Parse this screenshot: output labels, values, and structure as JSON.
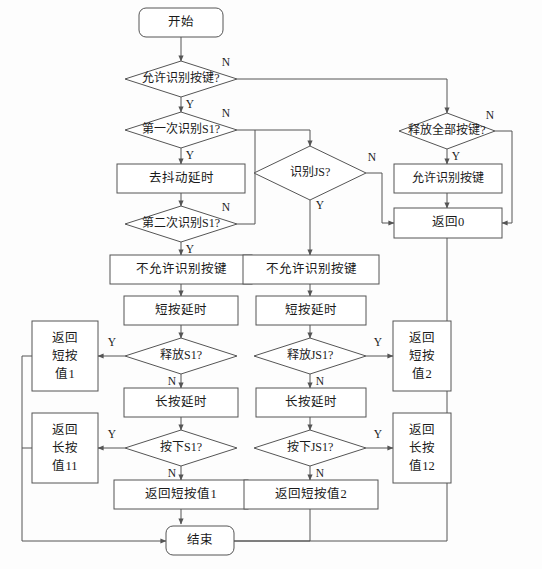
{
  "diagram": {
    "type": "flowchart",
    "colors": {
      "background": "#fdfdfd",
      "shape_fill": "#ffffff",
      "shape_stroke": "#555555",
      "text": "#1a1a1a"
    },
    "edge_labels": {
      "yes": "Y",
      "no": "N"
    },
    "nodes": {
      "start": {
        "text": "开始",
        "shape": "terminator"
      },
      "d_allow_detect": {
        "text": "允许识别按键?",
        "shape": "decision"
      },
      "d_first_s1": {
        "text": "第一次识别S1?",
        "shape": "decision"
      },
      "p_debounce": {
        "text": "去抖动延时",
        "shape": "process"
      },
      "d_second_s1": {
        "text": "第二次识别S1?",
        "shape": "decision"
      },
      "p_disallow_1": {
        "text": "不允许识别按键",
        "shape": "process"
      },
      "p_short_delay_1": {
        "text": "短按延时",
        "shape": "process"
      },
      "d_release_s1": {
        "text": "释放S1?",
        "shape": "decision"
      },
      "p_long_delay_1": {
        "text": "长按延时",
        "shape": "process"
      },
      "d_press_s1": {
        "text": "按下S1?",
        "shape": "decision"
      },
      "p_ret_short_1_inline": {
        "text": "返回短按值1",
        "shape": "process"
      },
      "d_detect_js": {
        "text": "识别JS?",
        "shape": "decision"
      },
      "p_disallow_2": {
        "text": "不允许识别按键",
        "shape": "process"
      },
      "p_short_delay_2": {
        "text": "短按延时",
        "shape": "process"
      },
      "d_release_js1": {
        "text": "释放JS1?",
        "shape": "decision"
      },
      "p_long_delay_2": {
        "text": "长按延时",
        "shape": "process"
      },
      "d_press_js1": {
        "text": "按下JS1?",
        "shape": "decision"
      },
      "p_ret_short_2_inline": {
        "text": "返回短按值2",
        "shape": "process"
      },
      "d_release_all": {
        "text": "释放全部按键?",
        "shape": "decision"
      },
      "p_allow_detect": {
        "text": "允许识别按键",
        "shape": "process"
      },
      "p_return_0": {
        "text": "返回0",
        "shape": "process"
      },
      "p_ret_short_1": {
        "line1": "返回",
        "line2": "短按",
        "line3": "值1",
        "shape": "process"
      },
      "p_ret_long_11": {
        "line1": "返回",
        "line2": "长按",
        "line3": "值11",
        "shape": "process"
      },
      "p_ret_short_2": {
        "line1": "返回",
        "line2": "短按",
        "line3": "值2",
        "shape": "process"
      },
      "p_ret_long_12": {
        "line1": "返回",
        "line2": "长按",
        "line3": "值12",
        "shape": "process"
      },
      "end": {
        "text": "结束",
        "shape": "terminator"
      }
    }
  }
}
